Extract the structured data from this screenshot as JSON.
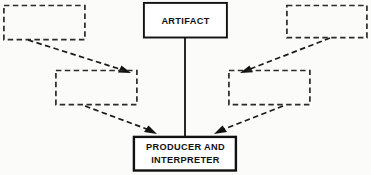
{
  "diagram": {
    "background_color": "#fbfbfa",
    "stroke_color": "#111111",
    "dashed_stroke_color": "#2a2a2a",
    "nodes": [
      {
        "id": "artifact",
        "label": "ARTIFACT",
        "style": "solid",
        "x": 143,
        "y": 2,
        "width": 84,
        "height": 36,
        "lines": [
          "ARTIFACT"
        ]
      },
      {
        "id": "top-left",
        "label": "",
        "style": "dashed",
        "x": 3,
        "y": 5,
        "width": 82,
        "height": 35,
        "lines": []
      },
      {
        "id": "top-right",
        "label": "",
        "style": "dashed",
        "x": 286,
        "y": 5,
        "width": 81,
        "height": 33,
        "lines": []
      },
      {
        "id": "mid-left",
        "label": "",
        "style": "dashed",
        "x": 55,
        "y": 70,
        "width": 82,
        "height": 35,
        "lines": []
      },
      {
        "id": "mid-right",
        "label": "",
        "style": "dashed",
        "x": 228,
        "y": 70,
        "width": 82,
        "height": 35,
        "lines": []
      },
      {
        "id": "producer-interpreter",
        "label": "PRODUCER AND INTERPRETER",
        "style": "solid",
        "x": 133,
        "y": 136,
        "width": 103,
        "height": 35,
        "lines": [
          "PRODUCER AND",
          "INTERPRETER"
        ]
      }
    ],
    "connectors": [
      {
        "id": "artifact-to-producer",
        "from": "artifact",
        "to": "producer-interpreter",
        "style": "solid",
        "arrowhead": false
      },
      {
        "id": "top-left-to-mid-left",
        "from": "top-left",
        "to": "mid-left",
        "style": "dashed",
        "arrowhead": true
      },
      {
        "id": "top-right-to-mid-right",
        "from": "top-right",
        "to": "mid-right",
        "style": "dashed",
        "arrowhead": true
      },
      {
        "id": "mid-left-to-producer",
        "from": "mid-left",
        "to": "producer-interpreter",
        "style": "dashed",
        "arrowhead": true
      },
      {
        "id": "mid-right-to-producer",
        "from": "mid-right",
        "to": "producer-interpreter",
        "style": "dashed",
        "arrowhead": true
      }
    ]
  }
}
